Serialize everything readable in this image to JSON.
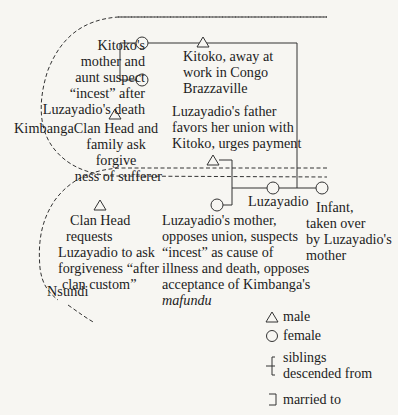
{
  "diagram": {
    "type": "kinship-diagram",
    "groups": [
      {
        "id": "kimbanga",
        "label": "Kimbanga"
      },
      {
        "id": "nsundi",
        "label": "Nsundi"
      }
    ],
    "nodes": {
      "kitoko_mother_aunt": {
        "symbols": [
          "female",
          "female"
        ],
        "text": [
          "Kitoko's",
          "mother and",
          "aunt suspect",
          "“incest” after",
          "Luzayadio's death"
        ]
      },
      "kitoko": {
        "symbol": "male",
        "text": [
          "Kitoko, away at",
          "work in Congo",
          "Brazzaville"
        ]
      },
      "kimbanga_clan_head": {
        "symbol": "male",
        "text": [
          "Clan Head and",
          "family ask forgive",
          "ness of sufferer"
        ]
      },
      "luzayadio_father": {
        "symbol": "male",
        "text": [
          "Luzayadio's father",
          "favors her union with",
          "Kitoko, urges payment"
        ]
      },
      "nsundi_clan_head": {
        "symbol": "male",
        "text": [
          "Clan Head",
          "requests",
          "Luzayadio to ask",
          "forgiveness “after",
          "clan custom”"
        ]
      },
      "luzayadio_mother": {
        "symbol": "female",
        "text": [
          "Luzayadio's mother,",
          "opposes union, suspects",
          "“incest” as cause of",
          "illness and death, opposes",
          "acceptance of Kimbanga's"
        ],
        "italic_last": "mafundu"
      },
      "luzayadio": {
        "symbol": "female",
        "label": "Luzayadio"
      },
      "infant": {
        "symbol": "female",
        "text": [
          "Infant,",
          "taken over",
          "by Luzayadio's",
          "mother"
        ]
      }
    }
  },
  "legend": {
    "items": [
      {
        "icon": "triangle-icon",
        "label": "male"
      },
      {
        "icon": "circle-icon",
        "label": "female"
      },
      {
        "icon": "sibling-bracket-icon",
        "label_lines": [
          "siblings",
          "descended from"
        ]
      },
      {
        "icon": "marriage-bracket-icon",
        "label": "married to"
      }
    ]
  }
}
